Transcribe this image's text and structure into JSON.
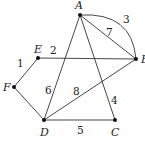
{
  "diagram": {
    "type": "weighted-graph",
    "nodes": [
      {
        "id": "A",
        "label": "A",
        "x": 80,
        "y": 15
      },
      {
        "id": "B",
        "label": "B",
        "x": 136,
        "y": 59
      },
      {
        "id": "E",
        "label": "E",
        "x": 38,
        "y": 58
      },
      {
        "id": "F",
        "label": "F",
        "x": 14,
        "y": 87
      },
      {
        "id": "D",
        "label": "D",
        "x": 44,
        "y": 120
      },
      {
        "id": "C",
        "label": "C",
        "x": 115,
        "y": 120
      }
    ],
    "edges": [
      {
        "from": "E",
        "to": "F",
        "weight": "1"
      },
      {
        "from": "E",
        "to": "B",
        "weight": "2"
      },
      {
        "from": "A",
        "to": "B",
        "weight": "3",
        "curved": true
      },
      {
        "from": "A",
        "to": "C",
        "weight": "4"
      },
      {
        "from": "D",
        "to": "C",
        "weight": "5"
      },
      {
        "from": "A",
        "to": "D",
        "weight": "6"
      },
      {
        "from": "A",
        "to": "B",
        "weight": "7"
      },
      {
        "from": "D",
        "to": "B",
        "weight": "8"
      },
      {
        "from": "F",
        "to": "D",
        "weight": ""
      }
    ],
    "line_color": "#333333"
  }
}
